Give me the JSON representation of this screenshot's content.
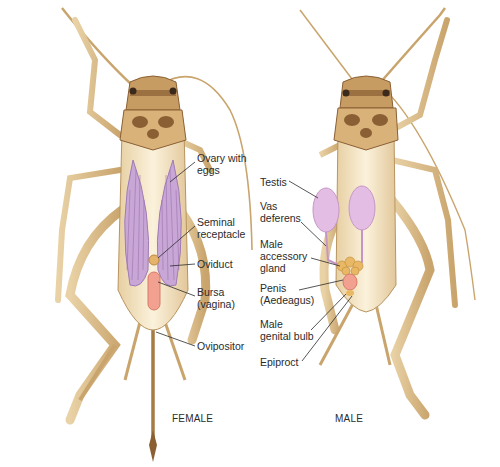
{
  "figure": {
    "female": {
      "caption": "FEMALE",
      "labels": [
        {
          "id": "ovary",
          "text": "Ovary with\neggs"
        },
        {
          "id": "seminal",
          "text": "Seminal\nreceptacle"
        },
        {
          "id": "oviduct",
          "text": "Oviduct"
        },
        {
          "id": "bursa",
          "text": "Bursa\n(vagina)"
        },
        {
          "id": "ovipositor",
          "text": "Ovipositor"
        }
      ]
    },
    "male": {
      "caption": "MALE",
      "labels": [
        {
          "id": "testis",
          "text": "Testis"
        },
        {
          "id": "vas",
          "text": "Vas\ndeferens"
        },
        {
          "id": "accessory",
          "text": "Male\naccessory\ngland"
        },
        {
          "id": "penis",
          "text": "Penis\n(Aedeagus)"
        },
        {
          "id": "bulb",
          "text": "Male\ngenital bulb"
        },
        {
          "id": "epiproct",
          "text": "Epiproct"
        }
      ]
    },
    "colors": {
      "body": "#f3e3c2",
      "body_edge": "#b99560",
      "head_dark": "#8a5f33",
      "ovary": "#c8a6d6",
      "testis": "#e3bde3",
      "bursa": "#f2a08f",
      "seminal": "#e6b36a",
      "accessory": "#e8b865"
    }
  }
}
